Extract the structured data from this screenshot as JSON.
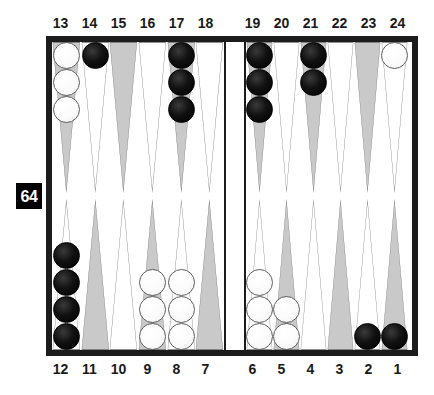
{
  "game": {
    "title": "Backgammon Board",
    "doubling_cube": {
      "value": "64",
      "label": "doubling cube value 64"
    }
  },
  "labels": {
    "top": [
      "13",
      "14",
      "15",
      "16",
      "17",
      "18",
      "19",
      "20",
      "21",
      "22",
      "23",
      "24"
    ],
    "bottom": [
      "12",
      "11",
      "10",
      "9",
      "8",
      "7",
      "6",
      "5",
      "4",
      "3",
      "2",
      "1"
    ]
  },
  "colors": {
    "frame": "#1c1c1c",
    "field": "#ffffff",
    "point_shaded": "#c9c9c9",
    "point_plain": "#ffffff",
    "point_outline": "#6e6e6e",
    "checker_black": "#000000",
    "checker_white": "#ffffff",
    "cube_bg": "#000000",
    "cube_text": "#ffffff"
  },
  "board_state": {
    "top_left": [
      {
        "point": "13",
        "shade": "shaded",
        "checkers": 3,
        "color": "white"
      },
      {
        "point": "14",
        "shade": "plain",
        "checkers": 1,
        "color": "black"
      },
      {
        "point": "15",
        "shade": "shaded",
        "checkers": 0,
        "color": "none"
      },
      {
        "point": "16",
        "shade": "plain",
        "checkers": 0,
        "color": "none"
      },
      {
        "point": "17",
        "shade": "shaded",
        "checkers": 3,
        "color": "black"
      },
      {
        "point": "18",
        "shade": "plain",
        "checkers": 0,
        "color": "none"
      }
    ],
    "top_right": [
      {
        "point": "19",
        "shade": "shaded",
        "checkers": 3,
        "color": "black"
      },
      {
        "point": "20",
        "shade": "plain",
        "checkers": 0,
        "color": "none"
      },
      {
        "point": "21",
        "shade": "shaded",
        "checkers": 2,
        "color": "black"
      },
      {
        "point": "22",
        "shade": "plain",
        "checkers": 0,
        "color": "none"
      },
      {
        "point": "23",
        "shade": "shaded",
        "checkers": 0,
        "color": "none"
      },
      {
        "point": "24",
        "shade": "plain",
        "checkers": 1,
        "color": "white"
      }
    ],
    "bottom_left": [
      {
        "point": "12",
        "shade": "plain",
        "checkers": 4,
        "color": "black"
      },
      {
        "point": "11",
        "shade": "shaded",
        "checkers": 0,
        "color": "none"
      },
      {
        "point": "10",
        "shade": "plain",
        "checkers": 0,
        "color": "none"
      },
      {
        "point": "9",
        "shade": "shaded",
        "checkers": 3,
        "color": "white"
      },
      {
        "point": "8",
        "shade": "plain",
        "checkers": 3,
        "color": "white"
      },
      {
        "point": "7",
        "shade": "shaded",
        "checkers": 0,
        "color": "none"
      }
    ],
    "bottom_right": [
      {
        "point": "6",
        "shade": "plain",
        "checkers": 3,
        "color": "white"
      },
      {
        "point": "5",
        "shade": "shaded",
        "checkers": 2,
        "color": "white"
      },
      {
        "point": "4",
        "shade": "plain",
        "checkers": 0,
        "color": "none"
      },
      {
        "point": "3",
        "shade": "shaded",
        "checkers": 0,
        "color": "none"
      },
      {
        "point": "2",
        "shade": "plain",
        "checkers": 1,
        "color": "black"
      },
      {
        "point": "1",
        "shade": "shaded",
        "checkers": 1,
        "color": "black"
      }
    ],
    "bar": {
      "black_on_bar": 0,
      "white_on_bar": 0
    }
  }
}
